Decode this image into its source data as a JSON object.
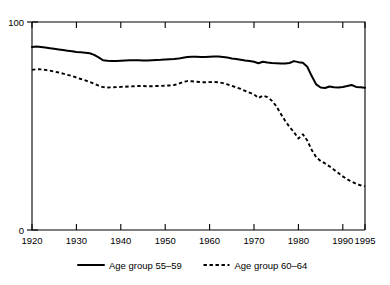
{
  "chart_data": {
    "type": "line",
    "title": "",
    "subtitle": "",
    "xlabel": "",
    "ylabel": "",
    "xlim": [
      1920,
      1995
    ],
    "ylim": [
      0,
      100
    ],
    "grid": false,
    "legend_position": "bottom",
    "x_ticks": [
      "1920",
      "1930",
      "1940",
      "1950",
      "1960",
      "1970",
      "1980",
      "1990",
      "1995"
    ],
    "x_tick_values": [
      1920,
      1930,
      1940,
      1950,
      1960,
      1970,
      1980,
      1990,
      1995
    ],
    "y_ticks": [
      "0",
      "100"
    ],
    "y_tick_values": [
      0,
      100
    ],
    "x": [
      1920,
      1921,
      1922,
      1923,
      1924,
      1925,
      1926,
      1927,
      1928,
      1929,
      1930,
      1931,
      1932,
      1933,
      1934,
      1935,
      1936,
      1937,
      1938,
      1939,
      1940,
      1941,
      1942,
      1943,
      1944,
      1945,
      1946,
      1947,
      1948,
      1949,
      1950,
      1951,
      1952,
      1953,
      1954,
      1955,
      1956,
      1957,
      1958,
      1959,
      1960,
      1961,
      1962,
      1963,
      1964,
      1965,
      1966,
      1967,
      1968,
      1969,
      1970,
      1971,
      1972,
      1973,
      1974,
      1975,
      1976,
      1977,
      1978,
      1979,
      1980,
      1981,
      1982,
      1983,
      1984,
      1985,
      1986,
      1987,
      1988,
      1989,
      1990,
      1991,
      1992,
      1993,
      1994,
      1995
    ],
    "series": [
      {
        "name": "Age group 55–59",
        "style": "solid",
        "color": "#000000",
        "values": [
          88.0,
          88.2,
          88.0,
          87.7,
          87.4,
          87.1,
          86.8,
          86.5,
          86.2,
          85.9,
          85.6,
          85.4,
          85.2,
          85.0,
          84.2,
          83.0,
          81.6,
          81.4,
          81.3,
          81.3,
          81.4,
          81.5,
          81.6,
          81.6,
          81.6,
          81.5,
          81.5,
          81.6,
          81.7,
          81.8,
          82.0,
          82.1,
          82.2,
          82.4,
          82.8,
          83.2,
          83.3,
          83.3,
          83.2,
          83.2,
          83.3,
          83.4,
          83.4,
          83.2,
          82.9,
          82.5,
          82.2,
          81.9,
          81.5,
          81.2,
          80.9,
          80.2,
          80.9,
          80.5,
          80.3,
          80.2,
          80.1,
          80.0,
          80.3,
          81.2,
          80.7,
          80.4,
          78.5,
          74.0,
          70.0,
          68.5,
          68.3,
          69.0,
          68.6,
          68.5,
          68.8,
          69.2,
          69.7,
          68.8,
          68.6,
          68.4
        ]
      },
      {
        "name": "Age group 60–64",
        "style": "dashed",
        "color": "#000000",
        "values": [
          77.0,
          77.3,
          77.2,
          77.0,
          76.6,
          76.2,
          75.7,
          75.2,
          74.6,
          74.0,
          73.3,
          72.6,
          71.9,
          71.2,
          70.3,
          69.4,
          68.7,
          68.5,
          68.6,
          68.7,
          68.8,
          68.9,
          69.0,
          69.1,
          69.2,
          69.2,
          69.1,
          69.1,
          69.2,
          69.3,
          69.4,
          69.5,
          69.7,
          70.3,
          71.2,
          71.6,
          71.5,
          71.3,
          71.1,
          71.0,
          71.1,
          71.2,
          71.0,
          70.6,
          70.0,
          69.3,
          68.6,
          67.8,
          66.9,
          66.0,
          65.2,
          63.5,
          64.6,
          63.9,
          62.2,
          59.6,
          56.0,
          52.5,
          49.6,
          47.0,
          44.0,
          46.0,
          43.0,
          38.5,
          35.0,
          33.2,
          32.0,
          30.6,
          29.0,
          27.4,
          25.8,
          24.4,
          23.2,
          22.2,
          21.5,
          21.0
        ]
      }
    ],
    "legend": [
      {
        "label": "Age group 55–59",
        "style": "solid"
      },
      {
        "label": "Age group 60–64",
        "style": "dashed"
      }
    ]
  }
}
